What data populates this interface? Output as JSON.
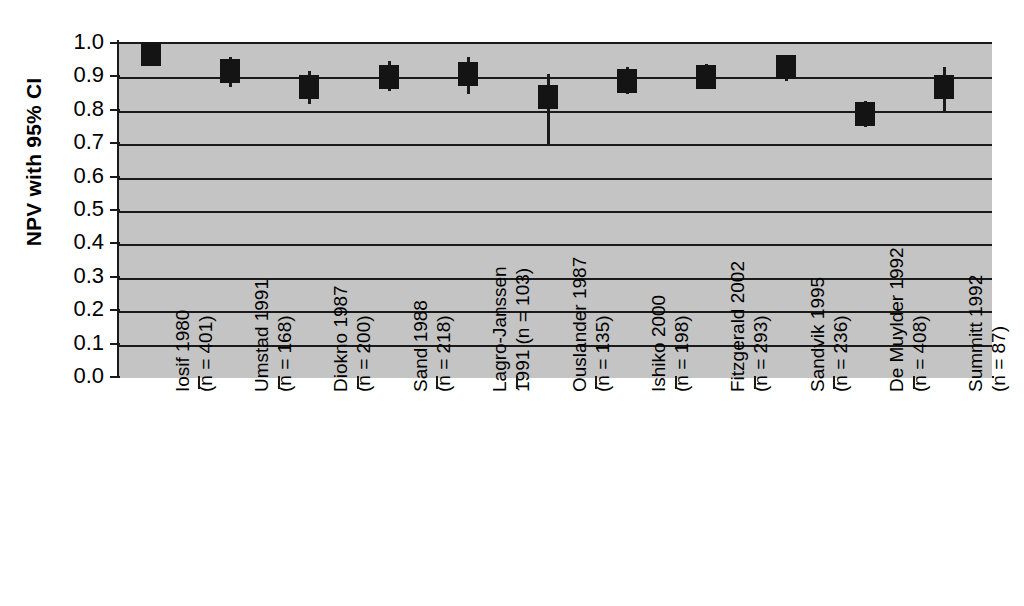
{
  "chart_data": {
    "type": "scatter",
    "title": "",
    "subtitle": "",
    "xlabel": "",
    "ylabel": "NPV with 95% CI",
    "ylim": [
      0.0,
      1.0
    ],
    "ytick_labels": [
      "1.0",
      "0.9",
      "0.8",
      "0.7",
      "0.6",
      "0.5",
      "0.4",
      "0.3",
      "0.2",
      "0.1",
      "0.0"
    ],
    "ytick_values": [
      1.0,
      0.9,
      0.8,
      0.7,
      0.6,
      0.5,
      0.4,
      0.3,
      0.2,
      0.1,
      0.0
    ],
    "grid": true,
    "grid_axis": "y",
    "legend": "none",
    "plot_background": "#c4c4c4",
    "marker_color": "#141414",
    "categories": [
      "Iosif 1980 (n = 401)",
      "Umstad 1991 (n = 168)",
      "Diokno 1987 (n = 200)",
      "Sand 1988 (n = 218)",
      "Lagro-Janssen 1991 (n = 103)",
      "Ouslander 1987 (n = 135)",
      "Ishiko 2000 (n = 198)",
      "Fitzgerald 2002 (n = 293)",
      "Sandvik 1995 (n = 236)",
      "De Muylder 1992 (n = 408)",
      "Summitt 1992 (n = 87)"
    ],
    "category_lines": [
      [
        "Iosif 1980",
        "(n = 401)"
      ],
      [
        "Umstad 1991",
        "(n = 168)"
      ],
      [
        "Diokno 1987",
        "(n = 200)"
      ],
      [
        "Sand 1988",
        "(n = 218)"
      ],
      [
        "Lagro-Janssen",
        "1991 (n = 103)"
      ],
      [
        "Ouslander 1987",
        "(n = 135)"
      ],
      [
        "Ishiko 2000",
        "(n = 198)"
      ],
      [
        "Fitzgerald 2002",
        "(n = 293)"
      ],
      [
        "Sandvik 1995",
        "(n = 236)"
      ],
      [
        "De Muylder 1992",
        "(n = 408)"
      ],
      [
        "Summitt 1992",
        "(n = 87)"
      ]
    ],
    "study_names": [
      "Iosif 1980",
      "Umstad 1991",
      "Diokno 1987",
      "Sand 1988",
      "Lagro-Janssen 1991",
      "Ouslander 1987",
      "Ishiko 2000",
      "Fitzgerald 2002",
      "Sandvik 1995",
      "De Muylder 1992",
      "Summitt 1992"
    ],
    "sample_sizes": [
      401,
      168,
      200,
      218,
      103,
      135,
      198,
      293,
      236,
      408,
      87
    ],
    "values": [
      0.97,
      0.92,
      0.87,
      0.9,
      0.91,
      0.84,
      0.89,
      0.9,
      0.93,
      0.79,
      0.87
    ],
    "ci_low": [
      0.95,
      0.87,
      0.82,
      0.86,
      0.85,
      0.7,
      0.85,
      0.87,
      0.89,
      0.75,
      0.8
    ],
    "ci_high": [
      0.99,
      0.96,
      0.92,
      0.95,
      0.96,
      0.91,
      0.93,
      0.94,
      0.96,
      0.83,
      0.93
    ]
  }
}
